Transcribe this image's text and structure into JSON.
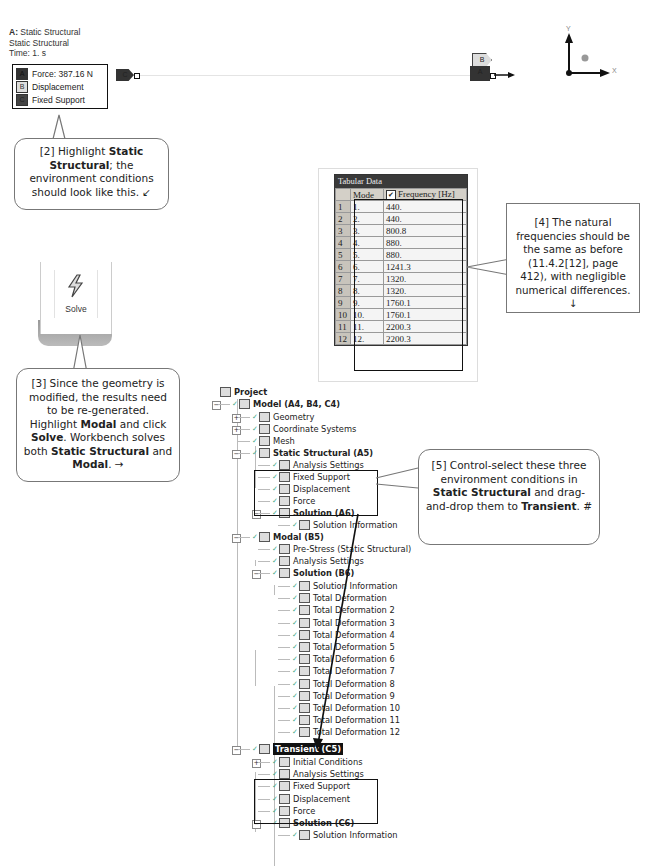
{
  "viewport": {
    "header": {
      "prefix": "A:",
      "title": "Static Structural",
      "subtitle": "Static Structural",
      "time": "Time: 1. s"
    },
    "legend": [
      {
        "key": "A",
        "label": "Force: 387.16 N"
      },
      {
        "key": "B",
        "label": "Displacement"
      },
      {
        "key": "C",
        "label": "Fixed Support"
      }
    ],
    "tags": {
      "left": "C",
      "right_top": "B",
      "right_bottom": "A"
    },
    "triad": {
      "x": "X",
      "y": "Y"
    }
  },
  "callouts": {
    "c2": {
      "pre": "[2] Highlight ",
      "bold1": "Static Structural",
      "post": "; the environment conditions should look like this. ↙"
    },
    "c3": {
      "pre": "[3] Since the geometry is modified, the results need to be re-generated.  Highlight ",
      "bold1": "Modal",
      "mid1": " and click ",
      "bold2": "Solve",
      "mid2": ". Workbench solves both ",
      "bold3": "Static Structural",
      "mid3": " and ",
      "bold4": "Modal",
      "post": ". →"
    },
    "c4": {
      "text": "[4] The natural frequencies should be the same as before (11.4.2[12], page 412), with negligible numerical differences. ↓"
    },
    "c5": {
      "pre": "[5] Control-select these three environment conditions in ",
      "bold1": "Static Structural",
      "mid1": " and drag-and-drop them to ",
      "bold2": "Transient",
      "post": ". #"
    }
  },
  "solve": {
    "label": "Solve",
    "icon": "lightning-icon"
  },
  "tabular": {
    "title": "Tabular Data",
    "headers": [
      "",
      "Mode",
      "Frequency [Hz]"
    ],
    "rows": [
      [
        "1",
        "1.",
        "440."
      ],
      [
        "2",
        "2.",
        "440."
      ],
      [
        "3",
        "3.",
        "800.8"
      ],
      [
        "4",
        "4.",
        "880."
      ],
      [
        "5",
        "5.",
        "880."
      ],
      [
        "6",
        "6.",
        "1241.3"
      ],
      [
        "7",
        "7.",
        "1320."
      ],
      [
        "8",
        "8.",
        "1320."
      ],
      [
        "9",
        "9.",
        "1760.1"
      ],
      [
        "10",
        "10.",
        "1760.1"
      ],
      [
        "11",
        "11.",
        "2200.3"
      ],
      [
        "12",
        "12.",
        "2200.3"
      ]
    ]
  },
  "tree": {
    "project": "Project",
    "model": "Model (A4, B4, C4)",
    "geometry": "Geometry",
    "coord": "Coordinate Systems",
    "mesh": "Mesh",
    "static": "Static Structural (A5)",
    "static_children": [
      "Analysis Settings",
      "Fixed Support",
      "Displacement",
      "Force"
    ],
    "solution_a6": "Solution (A6)",
    "solution_a6_children": [
      "Solution Information"
    ],
    "modal": "Modal (B5)",
    "modal_children": [
      "Pre-Stress (Static Structural)",
      "Analysis Settings"
    ],
    "solution_b6": "Solution (B6)",
    "solution_b6_children": [
      "Solution Information",
      "Total Deformation",
      "Total Deformation 2",
      "Total Deformation 3",
      "Total Deformation 4",
      "Total Deformation 5",
      "Total Deformation 6",
      "Total Deformation 7",
      "Total Deformation 8",
      "Total Deformation 9",
      "Total Deformation 10",
      "Total Deformation 11",
      "Total Deformation 12"
    ],
    "transient": "Transient (C5)",
    "transient_children": [
      "Initial Conditions",
      "Analysis Settings",
      "Fixed Support",
      "Displacement",
      "Force"
    ],
    "solution_c6": "Solution (C6)",
    "solution_c6_children": [
      "Solution Information"
    ]
  }
}
